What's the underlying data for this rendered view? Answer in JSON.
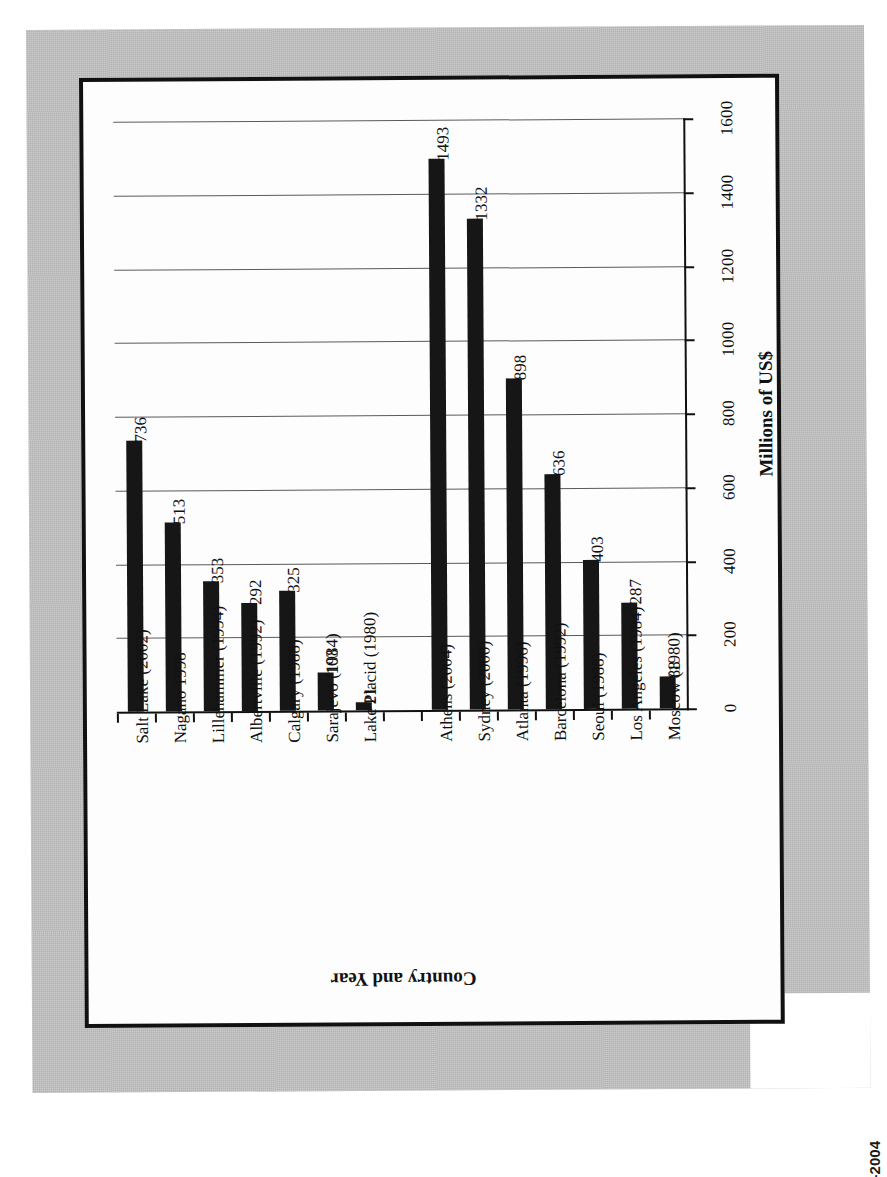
{
  "figure": {
    "caption": "Figure 4.1  Olympic broadcast rights, 1980-2004",
    "page_background": "#c3c3c3",
    "panel_background": "#fdfdfd",
    "bar_color": "#161616",
    "frame_color": "#111111"
  },
  "chart_data": {
    "type": "bar",
    "orientation": "rotated-90-ccw",
    "title": "",
    "xlabel": "Country and Year",
    "ylabel": "Millions of US$",
    "ylim": [
      0,
      1600
    ],
    "yticks": [
      0,
      200,
      400,
      600,
      800,
      1000,
      1200,
      1400,
      1600
    ],
    "grid": true,
    "legend": "none",
    "categories": [
      "Salt Lake (2002)",
      "Nagano 1998",
      "Lillehammer (1994)",
      "Albertville (1992)",
      "Calgary (1988)",
      "Sarajevo (1984)",
      "Lake Placid (1980)",
      "",
      "Athens (2004)",
      "Sydney (2000)",
      "Atlanta (1996)",
      "Barcelona (1992)",
      "Seoul (1988)",
      "Los Angeles (1984)",
      "Moscow (1980)"
    ],
    "values": [
      736,
      513,
      353,
      292,
      325,
      103,
      21,
      null,
      1493,
      1332,
      898,
      636,
      403,
      287,
      88
    ],
    "value_labels": [
      "736",
      "513",
      "353",
      "292",
      "325",
      "103",
      "21",
      "",
      "1493",
      "1332",
      "898",
      "636",
      "403",
      "287",
      "88"
    ],
    "ytick_labels": [
      "0",
      "200",
      "400",
      "600",
      "800",
      "1000",
      "1200",
      "1400",
      "1600"
    ]
  }
}
